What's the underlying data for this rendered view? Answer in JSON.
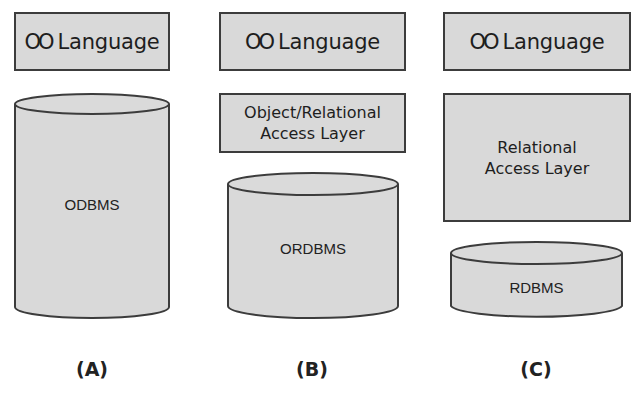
{
  "columns": [
    {
      "id": "A",
      "language_box": {
        "oo_symbol": "OO",
        "label": "Language"
      },
      "access_layer": null,
      "database": {
        "label": "ODBMS"
      },
      "caption": "(A)"
    },
    {
      "id": "B",
      "language_box": {
        "oo_symbol": "OO",
        "label": "Language"
      },
      "access_layer": {
        "line1": "Object/Relational",
        "line2": "Access Layer"
      },
      "database": {
        "label": "ORDBMS"
      },
      "caption": "(B)"
    },
    {
      "id": "C",
      "language_box": {
        "oo_symbol": "OO",
        "label": "Language"
      },
      "access_layer": {
        "line1": "Relational",
        "line2": "Access Layer"
      },
      "database": {
        "label": "RDBMS"
      },
      "caption": "(C)"
    }
  ],
  "colors": {
    "fill": "#d9d9d9",
    "stroke": "#3c3c3c",
    "background": "#ffffff"
  }
}
